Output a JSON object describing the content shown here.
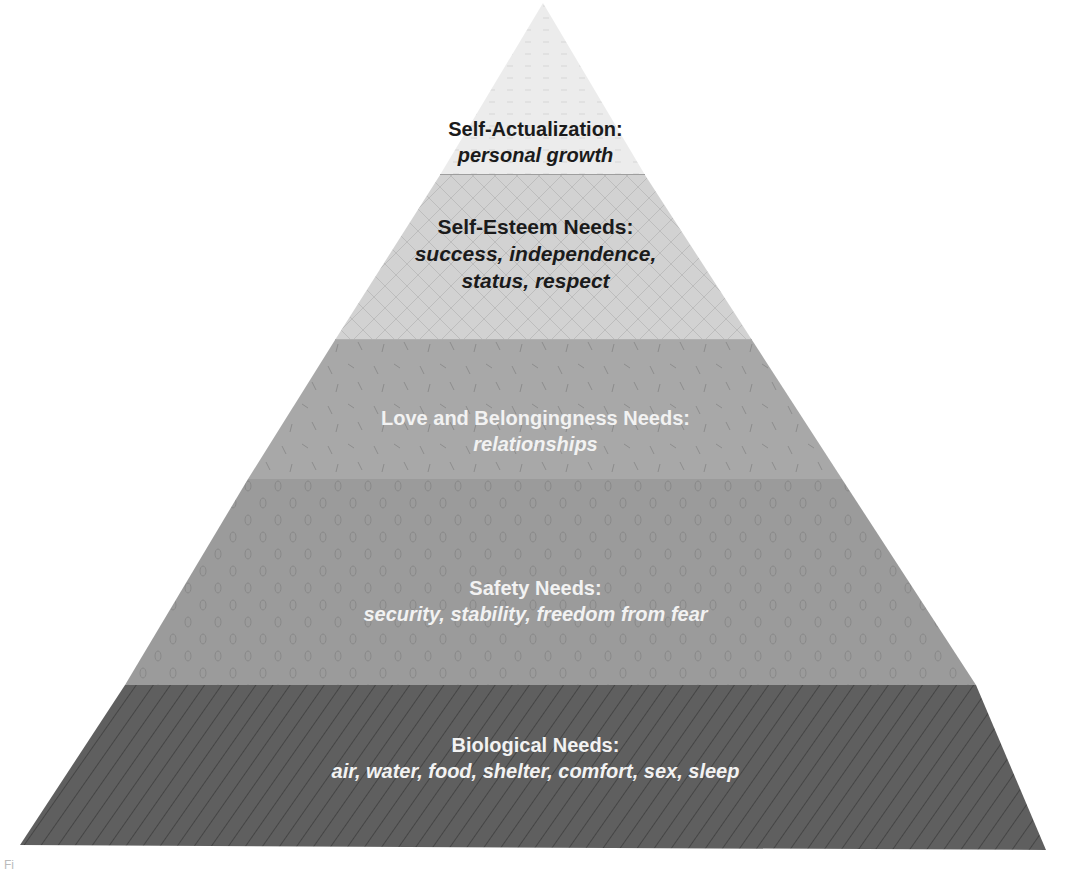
{
  "diagram": {
    "type": "pyramid",
    "apex": [
      543,
      3
    ],
    "base_left": [
      20,
      845
    ],
    "base_right": [
      1046,
      852
    ],
    "levels": [
      {
        "id": "self-actualization",
        "title": "Self-Actualization:",
        "subtitle": "personal growth",
        "fill": "#ececec",
        "pattern_stroke": "#d4d4d4",
        "text_color": "#1b1b1b",
        "y_top": 3,
        "y_bottom": 175
      },
      {
        "id": "self-esteem",
        "title": "Self-Esteem Needs:",
        "subtitle_lines": [
          "success, independence,",
          "status, respect"
        ],
        "fill": "#d2d2d2",
        "pattern_stroke": "#b9b9b9",
        "text_color": "#1b1b1b",
        "y_top": 175,
        "y_bottom": 340
      },
      {
        "id": "love-belongingness",
        "title": "Love and Belongingness Needs:",
        "subtitle": "relationships",
        "fill": "#a8a8a8",
        "pattern_stroke": "#8a8a8a",
        "text_color": "#f2f2f2",
        "y_top": 340,
        "y_bottom": 479
      },
      {
        "id": "safety",
        "title": "Safety Needs:",
        "subtitle": "security, stability, freedom from fear",
        "fill": "#9b9b9b",
        "pattern_stroke": "#858585",
        "text_color": "#f2f2f2",
        "y_top": 479,
        "y_bottom": 685
      },
      {
        "id": "biological",
        "title": "Biological Needs:",
        "subtitle": "air, water, food, shelter, comfort, sex, sleep",
        "fill": "#5f5f5f",
        "pattern_stroke": "#454545",
        "text_color": "#f2f2f2",
        "y_top": 685,
        "y_bottom": 848
      }
    ]
  },
  "caption_stub": "Fi"
}
